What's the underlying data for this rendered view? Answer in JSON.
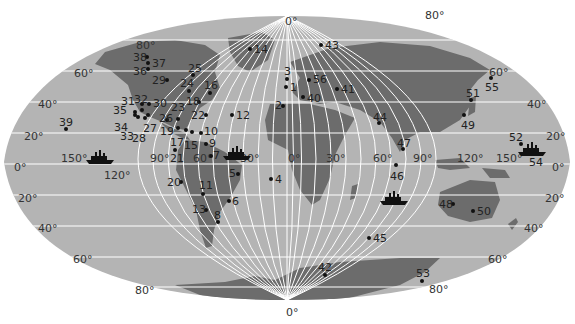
{
  "map": {
    "projection": "world-ellipse",
    "colors": {
      "ocean": "#b4b4b4",
      "land": "#6c6c6c",
      "grid": "#ffffff",
      "background": "#ffffff"
    },
    "lat_labels": [
      {
        "text": "80°",
        "x": 136,
        "y": 40
      },
      {
        "text": "60°",
        "x": 74,
        "y": 68
      },
      {
        "text": "40°",
        "x": 38,
        "y": 99
      },
      {
        "text": "20°",
        "x": 24,
        "y": 131
      },
      {
        "text": "0°",
        "x": 14,
        "y": 162
      },
      {
        "text": "20°",
        "x": 18,
        "y": 193
      },
      {
        "text": "40°",
        "x": 38,
        "y": 223
      },
      {
        "text": "60°",
        "x": 73,
        "y": 254
      },
      {
        "text": "80°",
        "x": 135,
        "y": 285
      },
      {
        "text": "80°",
        "x": 425,
        "y": 10
      },
      {
        "text": "60°",
        "x": 489,
        "y": 67
      },
      {
        "text": "40°",
        "x": 527,
        "y": 99
      },
      {
        "text": "20°",
        "x": 546,
        "y": 131
      },
      {
        "text": "0°",
        "x": 552,
        "y": 162
      },
      {
        "text": "20°",
        "x": 545,
        "y": 193
      },
      {
        "text": "40°",
        "x": 524,
        "y": 223
      },
      {
        "text": "60°",
        "x": 488,
        "y": 254
      },
      {
        "text": "80°",
        "x": 429,
        "y": 284
      }
    ],
    "lon_labels": [
      {
        "text": "0°",
        "x": 285,
        "y": 16
      },
      {
        "text": "0°",
        "x": 286,
        "y": 307
      },
      {
        "text": "150°",
        "x": 61,
        "y": 153
      },
      {
        "text": "120°",
        "x": 104,
        "y": 170
      },
      {
        "text": "90°",
        "x": 150,
        "y": 153
      },
      {
        "text": "60°",
        "x": 193,
        "y": 153
      },
      {
        "text": "30°",
        "x": 240,
        "y": 153
      },
      {
        "text": "0°",
        "x": 288,
        "y": 153
      },
      {
        "text": "30°",
        "x": 326,
        "y": 153
      },
      {
        "text": "60°",
        "x": 373,
        "y": 153
      },
      {
        "text": "90°",
        "x": 413,
        "y": 153
      },
      {
        "text": "120°",
        "x": 457,
        "y": 153
      },
      {
        "text": "150°",
        "x": 496,
        "y": 153
      }
    ],
    "points": [
      {
        "id": "1",
        "dx": 286,
        "dy": 87,
        "lx": 290,
        "ly": 82
      },
      {
        "id": "2",
        "dx": 283,
        "dy": 106,
        "lx": 275,
        "ly": 100
      },
      {
        "id": "3",
        "dx": 287,
        "dy": 79,
        "lx": 284,
        "ly": 66
      },
      {
        "id": "4",
        "dx": 271,
        "dy": 179,
        "lx": 275,
        "ly": 174
      },
      {
        "id": "5",
        "dx": 238,
        "dy": 174,
        "lx": 229,
        "ly": 168
      },
      {
        "id": "6",
        "dx": 229,
        "dy": 201,
        "lx": 232,
        "ly": 196
      },
      {
        "id": "7",
        "dx": 211,
        "dy": 156,
        "lx": 213,
        "ly": 150
      },
      {
        "id": "8",
        "dx": 218,
        "dy": 222,
        "lx": 214,
        "ly": 210
      },
      {
        "id": "9",
        "dx": 206,
        "dy": 144,
        "lx": 209,
        "ly": 138
      },
      {
        "id": "10",
        "dx": 201,
        "dy": 133,
        "lx": 204,
        "ly": 126
      },
      {
        "id": "11",
        "dx": 203,
        "dy": 194,
        "lx": 199,
        "ly": 180
      },
      {
        "id": "12",
        "dx": 232,
        "dy": 115,
        "lx": 236,
        "ly": 110
      },
      {
        "id": "13",
        "dx": 206,
        "dy": 210,
        "lx": 192,
        "ly": 204
      },
      {
        "id": "14",
        "dx": 250,
        "dy": 49,
        "lx": 254,
        "ly": 44
      },
      {
        "id": "15",
        "dx": 192,
        "dy": 132,
        "lx": 184,
        "ly": 140
      },
      {
        "id": "16",
        "dx": 210,
        "dy": 93,
        "lx": 204,
        "ly": 80
      },
      {
        "id": "17",
        "dx": 186,
        "dy": 130,
        "lx": 170,
        "ly": 137
      },
      {
        "id": "18",
        "dx": 199,
        "dy": 102,
        "lx": 186,
        "ly": 96
      },
      {
        "id": "19",
        "dx": 178,
        "dy": 128,
        "lx": 160,
        "ly": 126
      },
      {
        "id": "20",
        "dx": 181,
        "dy": 182,
        "lx": 167,
        "ly": 177
      },
      {
        "id": "21",
        "dx": 175,
        "dy": 150,
        "lx": 170,
        "ly": 153
      },
      {
        "id": "22",
        "dx": 206,
        "dy": 115,
        "lx": 191,
        "ly": 110
      },
      {
        "id": "23",
        "dx": 178,
        "dy": 119,
        "lx": 171,
        "ly": 102
      },
      {
        "id": "24",
        "dx": 189,
        "dy": 91,
        "lx": 180,
        "ly": 78
      },
      {
        "id": "25",
        "dx": 193,
        "dy": 75,
        "lx": 188,
        "ly": 63
      },
      {
        "id": "26",
        "dx": 167,
        "dy": 120,
        "lx": 159,
        "ly": 113
      },
      {
        "id": "27",
        "dx": 148,
        "dy": 115,
        "lx": 143,
        "ly": 123
      },
      {
        "id": "28",
        "dx": 145,
        "dy": 118,
        "lx": 132,
        "ly": 133
      },
      {
        "id": "29",
        "dx": 167,
        "dy": 80,
        "lx": 152,
        "ly": 75
      },
      {
        "id": "30",
        "dx": 149,
        "dy": 104,
        "lx": 153,
        "ly": 98
      },
      {
        "id": "31",
        "dx": 142,
        "dy": 104,
        "lx": 121,
        "ly": 96
      },
      {
        "id": "32",
        "dx": 142,
        "dy": 110,
        "lx": 134,
        "ly": 94
      },
      {
        "id": "33",
        "dx": 138,
        "dy": 117,
        "lx": 120,
        "ly": 131
      },
      {
        "id": "34",
        "dx": 135,
        "dy": 115,
        "lx": 114,
        "ly": 122
      },
      {
        "id": "35",
        "dx": 135,
        "dy": 112,
        "lx": 113,
        "ly": 105
      },
      {
        "id": "36",
        "dx": 148,
        "dy": 69,
        "lx": 133,
        "ly": 66
      },
      {
        "id": "37",
        "dx": 148,
        "dy": 63,
        "lx": 152,
        "ly": 58
      },
      {
        "id": "38",
        "dx": 147,
        "dy": 57,
        "lx": 133,
        "ly": 52
      },
      {
        "id": "39",
        "dx": 66,
        "dy": 129,
        "lx": 59,
        "ly": 117
      },
      {
        "id": "40",
        "dx": 303,
        "dy": 97,
        "lx": 307,
        "ly": 93
      },
      {
        "id": "41",
        "dx": 337,
        "dy": 89,
        "lx": 341,
        "ly": 84
      },
      {
        "id": "42",
        "dx": 325,
        "dy": 275,
        "lx": 318,
        "ly": 262
      },
      {
        "id": "43",
        "dx": 321,
        "dy": 45,
        "lx": 325,
        "ly": 40
      },
      {
        "id": "44",
        "dx": 379,
        "dy": 123,
        "lx": 373,
        "ly": 112
      },
      {
        "id": "45",
        "dx": 369,
        "dy": 238,
        "lx": 373,
        "ly": 233
      },
      {
        "id": "46",
        "dx": 396,
        "dy": 165,
        "lx": 390,
        "ly": 171
      },
      {
        "id": "47",
        "dx": 403,
        "dy": 149,
        "lx": 397,
        "ly": 138
      },
      {
        "id": "48",
        "dx": 453,
        "dy": 204,
        "lx": 439,
        "ly": 199
      },
      {
        "id": "49",
        "dx": 464,
        "dy": 115,
        "lx": 461,
        "ly": 120
      },
      {
        "id": "50",
        "dx": 473,
        "dy": 211,
        "lx": 477,
        "ly": 206
      },
      {
        "id": "51",
        "dx": 471,
        "dy": 100,
        "lx": 466,
        "ly": 88
      },
      {
        "id": "52",
        "dx": 521,
        "dy": 144,
        "lx": 509,
        "ly": 132
      },
      {
        "id": "53",
        "dx": 422,
        "dy": 281,
        "lx": 416,
        "ly": 268
      },
      {
        "id": "54",
        "dx": 532,
        "dy": 152,
        "lx": 529,
        "ly": 157
      },
      {
        "id": "55",
        "dx": 491,
        "dy": 78,
        "lx": 485,
        "ly": 82
      },
      {
        "id": "56",
        "dx": 309,
        "dy": 80,
        "lx": 313,
        "ly": 74
      }
    ],
    "ships": [
      {
        "name": "ship-icon-pacific",
        "x": 86,
        "y": 149
      },
      {
        "name": "ship-icon-atlantic",
        "x": 223,
        "y": 145
      },
      {
        "name": "ship-icon-indian",
        "x": 380,
        "y": 190
      },
      {
        "name": "ship-icon-west-pacific",
        "x": 518,
        "y": 141
      }
    ]
  }
}
